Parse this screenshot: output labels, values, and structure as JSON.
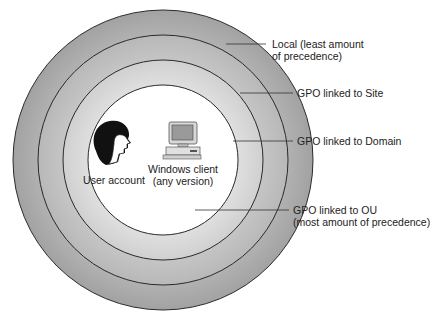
{
  "diagram": {
    "rings": [
      {
        "name": "local",
        "label_line1": "Local (least amount",
        "label_line2": "of precedence)",
        "fill": "#a9a9a9",
        "radius": 150
      },
      {
        "name": "site",
        "label_line1": "GPO linked to Site",
        "fill": "#bdbdbd",
        "radius": 125
      },
      {
        "name": "domain",
        "label_line1": "GPO linked to Domain",
        "fill": "#d4d4d4",
        "radius": 100
      },
      {
        "name": "ou",
        "label_line1": "GPO linked to OU",
        "label_line2": "(most amount of precedence)",
        "fill": "#ffffff",
        "radius": 75
      }
    ],
    "center_items": {
      "user": {
        "label": "User account",
        "icon": "user-head-icon"
      },
      "client": {
        "label_line1": "Windows client",
        "label_line2": "(any version)",
        "icon": "desktop-computer-icon"
      }
    },
    "colors": {
      "stroke": "#2a2a2a",
      "text": "#222222"
    }
  }
}
